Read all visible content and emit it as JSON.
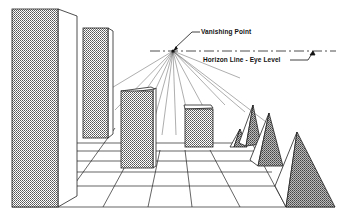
{
  "diagram": {
    "labels": {
      "vanishing_point": "Vanishing Point",
      "horizon_line": "Horizon Line - Eye Level"
    },
    "vanishing_point": {
      "x": 173,
      "y": 51
    },
    "horizon_y": 51,
    "colors": {
      "line": "#1a1a1a",
      "shade": "#8a8a8a",
      "background": "#ffffff"
    },
    "objects": [
      {
        "type": "tall-box",
        "name": "near-left-tall-box"
      },
      {
        "type": "tall-box",
        "name": "far-left-tall-box"
      },
      {
        "type": "box",
        "name": "center-box"
      },
      {
        "type": "box",
        "name": "center-right-box"
      },
      {
        "type": "pyramid",
        "name": "pyramid-1"
      },
      {
        "type": "pyramid",
        "name": "pyramid-2"
      },
      {
        "type": "pyramid",
        "name": "pyramid-3"
      },
      {
        "type": "pyramid",
        "name": "pyramid-4"
      }
    ]
  }
}
